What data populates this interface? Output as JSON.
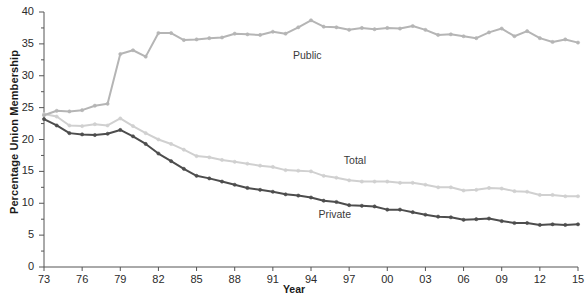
{
  "chart_data": {
    "type": "line",
    "title": "",
    "xlabel": "Year",
    "ylabel": "Percentage Union Membership",
    "xlim": [
      1973,
      2015
    ],
    "ylim": [
      0,
      40
    ],
    "grid": false,
    "legend_position": "inline-annotations",
    "ytick_labels": [
      "0",
      "5",
      "10",
      "15",
      "20",
      "25",
      "30",
      "35",
      "40"
    ],
    "ytick_values": [
      0,
      5,
      10,
      15,
      20,
      25,
      30,
      35,
      40
    ],
    "yminor_step": 2.5,
    "xtick_labels": [
      "73",
      "76",
      "79",
      "82",
      "85",
      "88",
      "91",
      "94",
      "97",
      "00",
      "03",
      "06",
      "09",
      "12",
      "15"
    ],
    "xtick_values": [
      1973,
      1976,
      1979,
      1982,
      1985,
      1988,
      1991,
      1994,
      1997,
      2000,
      2003,
      2006,
      2009,
      2012,
      2015
    ],
    "x": [
      1973,
      1974,
      1975,
      1976,
      1977,
      1978,
      1979,
      1980,
      1981,
      1982,
      1983,
      1984,
      1985,
      1986,
      1987,
      1988,
      1989,
      1990,
      1991,
      1992,
      1993,
      1994,
      1995,
      1996,
      1997,
      1998,
      1999,
      2000,
      2001,
      2002,
      2003,
      2004,
      2005,
      2006,
      2007,
      2008,
      2009,
      2010,
      2011,
      2012,
      2013,
      2014,
      2015
    ],
    "series": [
      {
        "name": "Public",
        "color": "#b5b5b5",
        "values": [
          23.8,
          24.5,
          24.4,
          24.6,
          25.3,
          25.6,
          33.4,
          34.0,
          33.0,
          36.7,
          36.7,
          35.6,
          35.7,
          35.9,
          36.0,
          36.6,
          36.5,
          36.4,
          36.9,
          36.6,
          37.6,
          38.7,
          37.7,
          37.6,
          37.2,
          37.5,
          37.3,
          37.5,
          37.4,
          37.8,
          37.2,
          36.4,
          36.5,
          36.2,
          35.9,
          36.8,
          37.4,
          36.2,
          37.0,
          35.9,
          35.3,
          35.7,
          35.2
        ]
      },
      {
        "name": "Total",
        "color": "#d0d0d0",
        "values": [
          24.0,
          23.6,
          22.2,
          22.1,
          22.4,
          22.2,
          23.3,
          22.1,
          21.0,
          20.0,
          19.3,
          18.4,
          17.4,
          17.2,
          16.8,
          16.5,
          16.2,
          15.9,
          15.7,
          15.2,
          15.1,
          15.0,
          14.3,
          14.0,
          13.6,
          13.4,
          13.4,
          13.4,
          13.2,
          13.2,
          12.9,
          12.5,
          12.5,
          12.0,
          12.1,
          12.4,
          12.3,
          11.9,
          11.8,
          11.3,
          11.3,
          11.1,
          11.1
        ]
      },
      {
        "name": "Private",
        "color": "#4d4d4d",
        "values": [
          23.2,
          22.2,
          21.0,
          20.8,
          20.7,
          20.9,
          21.5,
          20.5,
          19.3,
          17.8,
          16.6,
          15.4,
          14.3,
          13.9,
          13.4,
          12.9,
          12.4,
          12.1,
          11.8,
          11.4,
          11.2,
          10.9,
          10.4,
          10.2,
          9.7,
          9.6,
          9.5,
          9.0,
          9.0,
          8.6,
          8.2,
          7.9,
          7.8,
          7.4,
          7.5,
          7.6,
          7.2,
          6.9,
          6.9,
          6.6,
          6.7,
          6.6,
          6.7
        ]
      }
    ],
    "annotations": [
      {
        "text": "Public",
        "x": 1994,
        "y": 33.0
      },
      {
        "text": "Total",
        "x": 1998,
        "y": 16.5
      },
      {
        "text": "Private",
        "x": 1996,
        "y": 8.0
      }
    ]
  }
}
